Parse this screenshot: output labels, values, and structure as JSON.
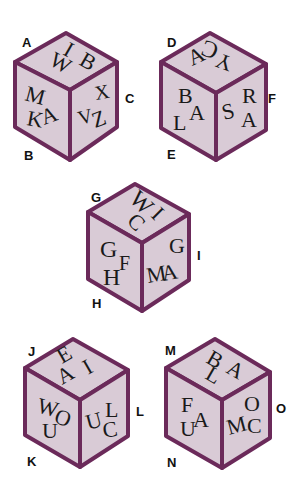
{
  "colors": {
    "face": "#d9cbd6",
    "edge": "#6b2a5a",
    "label": "#111111",
    "glyph": "#1a1a1a"
  },
  "cubes": [
    {
      "id": "cube-1",
      "labels": {
        "top_left": "A",
        "bottom_left": "B",
        "right": "C"
      },
      "faces": {
        "top": [
          "I",
          "B",
          "W"
        ],
        "left": [
          "M",
          "K",
          "A"
        ],
        "right": [
          "V",
          "X",
          "Z"
        ]
      }
    },
    {
      "id": "cube-2",
      "labels": {
        "top_left": "D",
        "bottom_left": "E",
        "right": "F"
      },
      "faces": {
        "top": [
          "C",
          "Y",
          "A"
        ],
        "left": [
          "B",
          "L",
          "A"
        ],
        "right": [
          "S",
          "R",
          "A"
        ]
      }
    },
    {
      "id": "cube-3",
      "labels": {
        "top_left": "G",
        "bottom_left": "H",
        "right": "I"
      },
      "faces": {
        "top": [
          "W",
          "I",
          "C"
        ],
        "left": [
          "G",
          "H",
          "F"
        ],
        "right": [
          "M",
          "G",
          "A"
        ]
      }
    },
    {
      "id": "cube-4",
      "labels": {
        "top_left": "J",
        "bottom_left": "K",
        "right": "L"
      },
      "faces": {
        "top": [
          "E",
          "I",
          "A"
        ],
        "left": [
          "W",
          "O",
          "U"
        ],
        "right": [
          "U",
          "L",
          "C"
        ]
      }
    },
    {
      "id": "cube-5",
      "labels": {
        "top_left": "M",
        "bottom_left": "N",
        "right": "O"
      },
      "faces": {
        "top": [
          "B",
          "A",
          "L"
        ],
        "left": [
          "F",
          "A",
          "U"
        ],
        "right": [
          "M",
          "O",
          "C"
        ]
      }
    }
  ]
}
